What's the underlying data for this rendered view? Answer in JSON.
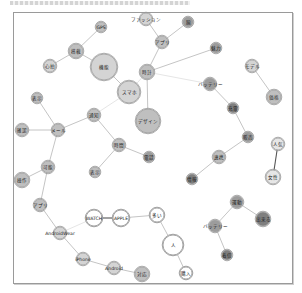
{
  "diagram": {
    "type": "network",
    "frame": {
      "left": 13,
      "top": 12,
      "right": 291,
      "bottom": 282
    },
    "colors": {
      "light": "#d4d4d4",
      "mid": "#bfbfbf",
      "dark": "#9c9c9c",
      "darkest": "#7f7f7f",
      "open": "#ffffff",
      "edge": "#bdbdbd",
      "edge_strong": "#555555"
    },
    "nodes": [
      {
        "id": "n1",
        "label": "機能",
        "x": 104,
        "y": 67,
        "r": 13,
        "shade": "light"
      },
      {
        "id": "n2",
        "label": "スマホ",
        "x": 129,
        "y": 92,
        "r": 11,
        "shade": "light"
      },
      {
        "id": "n3",
        "label": "デザイン",
        "x": 148,
        "y": 121,
        "r": 12,
        "shade": "mid"
      },
      {
        "id": "n4",
        "label": "時計",
        "x": 147,
        "y": 72,
        "r": 7,
        "shade": "mid"
      },
      {
        "id": "n5",
        "label": "搭載",
        "x": 76,
        "y": 51,
        "r": 7,
        "shade": "mid"
      },
      {
        "id": "n6",
        "label": "GPS",
        "x": 101,
        "y": 27,
        "r": 5,
        "shade": "mid"
      },
      {
        "id": "n7",
        "label": "心拍",
        "x": 50,
        "y": 66,
        "r": 6,
        "shade": "light"
      },
      {
        "id": "n8",
        "label": "ファッション",
        "x": 146,
        "y": 19,
        "r": 6,
        "shade": "light"
      },
      {
        "id": "n9",
        "label": "アプリ",
        "x": 162,
        "y": 42,
        "r": 6,
        "shade": "mid"
      },
      {
        "id": "n10",
        "label": "腕",
        "x": 188,
        "y": 22,
        "r": 5,
        "shade": "dark"
      },
      {
        "id": "n11",
        "label": "魅力",
        "x": 216,
        "y": 48,
        "r": 5,
        "shade": "dark"
      },
      {
        "id": "n12",
        "label": "バッテリー",
        "x": 210,
        "y": 84,
        "r": 6,
        "shade": "dark"
      },
      {
        "id": "n13",
        "label": "充電",
        "x": 233,
        "y": 108,
        "r": 5,
        "shade": "darkest"
      },
      {
        "id": "n14",
        "label": "モデル",
        "x": 252,
        "y": 66,
        "r": 6,
        "shade": "light"
      },
      {
        "id": "n15",
        "label": "価格",
        "x": 274,
        "y": 97,
        "r": 7,
        "shade": "mid"
      },
      {
        "id": "n16",
        "label": "販売",
        "x": 248,
        "y": 137,
        "r": 5,
        "shade": "dark"
      },
      {
        "id": "n17",
        "label": "連携",
        "x": 219,
        "y": 157,
        "r": 6,
        "shade": "mid"
      },
      {
        "id": "n18",
        "label": "情報",
        "x": 192,
        "y": 179,
        "r": 5,
        "shade": "darkest"
      },
      {
        "id": "n19",
        "label": "人気",
        "x": 278,
        "y": 144,
        "r": 6,
        "shade": "open-light"
      },
      {
        "id": "n20",
        "label": "女性",
        "x": 273,
        "y": 177,
        "r": 7,
        "shade": "open-light"
      },
      {
        "id": "n21",
        "label": "通知",
        "x": 94,
        "y": 115,
        "r": 6,
        "shade": "mid"
      },
      {
        "id": "n22",
        "label": "表示",
        "x": 37,
        "y": 98,
        "r": 5,
        "shade": "mid"
      },
      {
        "id": "n23",
        "label": "メール",
        "x": 58,
        "y": 130,
        "r": 6,
        "shade": "mid"
      },
      {
        "id": "n24",
        "label": "確認",
        "x": 22,
        "y": 130,
        "r": 6,
        "shade": "mid"
      },
      {
        "id": "n25",
        "label": "時間",
        "x": 119,
        "y": 145,
        "r": 6,
        "shade": "mid"
      },
      {
        "id": "n26",
        "label": "電話",
        "x": 149,
        "y": 157,
        "r": 5,
        "shade": "dark"
      },
      {
        "id": "n27",
        "label": "表示",
        "x": 95,
        "y": 172,
        "r": 5,
        "shade": "mid"
      },
      {
        "id": "n28",
        "label": "可能",
        "x": 48,
        "y": 167,
        "r": 6,
        "shade": "mid"
      },
      {
        "id": "n29",
        "label": "操作",
        "x": 22,
        "y": 180,
        "r": 7,
        "shade": "mid"
      },
      {
        "id": "n30",
        "label": "アプリ",
        "x": 40,
        "y": 205,
        "r": 6,
        "shade": "mid"
      },
      {
        "id": "n31",
        "label": "WATCH",
        "x": 94,
        "y": 218,
        "r": 8,
        "shade": "open"
      },
      {
        "id": "n32",
        "label": "APPLE",
        "x": 121,
        "y": 218,
        "r": 8,
        "shade": "open"
      },
      {
        "id": "n33",
        "label": "多い",
        "x": 157,
        "y": 215,
        "r": 7,
        "shade": "open"
      },
      {
        "id": "n34",
        "label": "人",
        "x": 173,
        "y": 245,
        "r": 10,
        "shade": "open"
      },
      {
        "id": "n35",
        "label": "購入",
        "x": 186,
        "y": 273,
        "r": 6,
        "shade": "open"
      },
      {
        "id": "n36",
        "label": "AndroidWear",
        "x": 60,
        "y": 233,
        "r": 6,
        "shade": "light"
      },
      {
        "id": "n37",
        "label": "iPhone",
        "x": 83,
        "y": 259,
        "r": 6,
        "shade": "light"
      },
      {
        "id": "n38",
        "label": "Android",
        "x": 114,
        "y": 268,
        "r": 6,
        "shade": "light"
      },
      {
        "id": "n39",
        "label": "対応",
        "x": 142,
        "y": 274,
        "r": 7,
        "shade": "mid"
      },
      {
        "id": "n40",
        "label": "運動",
        "x": 237,
        "y": 202,
        "r": 6,
        "shade": "dark"
      },
      {
        "id": "n41",
        "label": "出来る",
        "x": 263,
        "y": 219,
        "r": 7,
        "shade": "darkest"
      },
      {
        "id": "n42",
        "label": "バッテリー",
        "x": 215,
        "y": 226,
        "r": 6,
        "shade": "dark"
      },
      {
        "id": "n43",
        "label": "着信",
        "x": 227,
        "y": 255,
        "r": 5,
        "shade": "darkest"
      }
    ],
    "edges": [
      {
        "from": "n1",
        "to": "n2",
        "style": "normal"
      },
      {
        "from": "n1",
        "to": "n5",
        "style": "normal"
      },
      {
        "from": "n5",
        "to": "n6",
        "style": "normal"
      },
      {
        "from": "n5",
        "to": "n7",
        "style": "normal"
      },
      {
        "from": "n2",
        "to": "n4",
        "style": "faint"
      },
      {
        "from": "n2",
        "to": "n21",
        "style": "faint"
      },
      {
        "from": "n4",
        "to": "n3",
        "style": "normal"
      },
      {
        "from": "n4",
        "to": "n9",
        "style": "normal"
      },
      {
        "from": "n9",
        "to": "n8",
        "style": "normal"
      },
      {
        "from": "n9",
        "to": "n10",
        "style": "normal"
      },
      {
        "from": "n4",
        "to": "n11",
        "style": "normal"
      },
      {
        "from": "n4",
        "to": "n12",
        "style": "faint"
      },
      {
        "from": "n12",
        "to": "n13",
        "style": "normal"
      },
      {
        "from": "n13",
        "to": "n16",
        "style": "normal"
      },
      {
        "from": "n16",
        "to": "n17",
        "style": "normal"
      },
      {
        "from": "n17",
        "to": "n18",
        "style": "normal"
      },
      {
        "from": "n14",
        "to": "n15",
        "style": "normal"
      },
      {
        "from": "n19",
        "to": "n20",
        "style": "dark"
      },
      {
        "from": "n21",
        "to": "n23",
        "style": "normal"
      },
      {
        "from": "n22",
        "to": "n23",
        "style": "normal"
      },
      {
        "from": "n24",
        "to": "n23",
        "style": "normal"
      },
      {
        "from": "n21",
        "to": "n25",
        "style": "normal"
      },
      {
        "from": "n25",
        "to": "n26",
        "style": "normal"
      },
      {
        "from": "n25",
        "to": "n27",
        "style": "normal"
      },
      {
        "from": "n23",
        "to": "n28",
        "style": "normal"
      },
      {
        "from": "n28",
        "to": "n29",
        "style": "normal"
      },
      {
        "from": "n28",
        "to": "n30",
        "style": "normal"
      },
      {
        "from": "n30",
        "to": "n36",
        "style": "normal"
      },
      {
        "from": "n31",
        "to": "n32",
        "style": "dark"
      },
      {
        "from": "n32",
        "to": "n33",
        "style": "normal"
      },
      {
        "from": "n33",
        "to": "n34",
        "style": "normal"
      },
      {
        "from": "n34",
        "to": "n35",
        "style": "normal"
      },
      {
        "from": "n31",
        "to": "n36",
        "style": "faint"
      },
      {
        "from": "n36",
        "to": "n37",
        "style": "normal"
      },
      {
        "from": "n37",
        "to": "n38",
        "style": "normal"
      },
      {
        "from": "n38",
        "to": "n39",
        "style": "normal"
      },
      {
        "from": "n40",
        "to": "n41",
        "style": "normal"
      },
      {
        "from": "n40",
        "to": "n42",
        "style": "normal"
      },
      {
        "from": "n42",
        "to": "n43",
        "style": "normal"
      }
    ]
  }
}
